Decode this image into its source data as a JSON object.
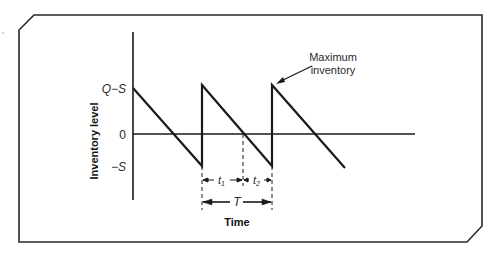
{
  "diagram": {
    "type": "inventory sawtooth (planned shortage model)",
    "y_axis_label": "Inventory level",
    "x_axis_label": "Time",
    "y_ticks": [
      {
        "label": "Q−S",
        "meaning": "maximum inventory level"
      },
      {
        "label": "0",
        "meaning": "zero inventory"
      },
      {
        "label": "−S",
        "meaning": "maximum shortage"
      }
    ],
    "annotation": {
      "line1": "Maximum",
      "line2": "inventory"
    },
    "intervals": {
      "t1": "t",
      "t1_sub": "1",
      "t2": "t",
      "t2_sub": "2",
      "cycle": "T"
    },
    "colors": {
      "line": "#1a1a1a",
      "text": "#2b2b2b",
      "frame": "#2a2a2a"
    }
  }
}
